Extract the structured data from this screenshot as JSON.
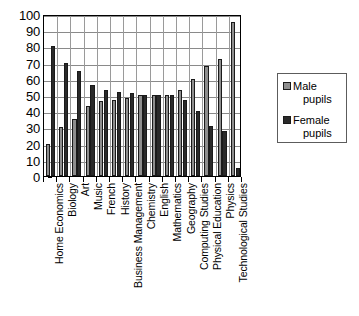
{
  "chart_data": {
    "type": "bar",
    "title": "",
    "subtitle": "",
    "xlabel": "",
    "ylabel": "",
    "ylim": [
      0,
      100
    ],
    "ytick_step": 10,
    "yticks": [
      0,
      10,
      20,
      30,
      40,
      50,
      60,
      70,
      80,
      90,
      100
    ],
    "grid": true,
    "grid_axis": "y",
    "legend_position": "right",
    "orientation": "vertical",
    "grouping": "grouped",
    "categories": [
      "Home Economics",
      "Biology",
      "Art",
      "Music",
      "French",
      "History",
      "Business Management",
      "Chemistry",
      "English",
      "Mathematics",
      "Geography",
      "Computing Studies",
      "Physical Education",
      "Physics",
      "Technological Studies"
    ],
    "series": [
      {
        "name": "Male pupils",
        "color": "#8e8e8e",
        "values": [
          20,
          30,
          35,
          43,
          46,
          47,
          48,
          50,
          50,
          50,
          53,
          60,
          68,
          72,
          95
        ]
      },
      {
        "name": "Female pupils",
        "color": "#2a2a2a",
        "values": [
          80,
          70,
          65,
          56,
          53,
          52,
          51,
          50,
          50,
          50,
          47,
          40,
          31,
          28,
          5
        ]
      }
    ]
  },
  "legend": {
    "title": "",
    "entries": [
      {
        "swatch": "male",
        "line1": "Male",
        "line2": "pupils"
      },
      {
        "swatch": "female",
        "line1": "Female",
        "line2": "pupils"
      }
    ]
  },
  "axes": {
    "y_tick_labels": [
      "100",
      "90",
      "80",
      "70",
      "60",
      "50",
      "40",
      "30",
      "20",
      "10",
      "0"
    ]
  }
}
